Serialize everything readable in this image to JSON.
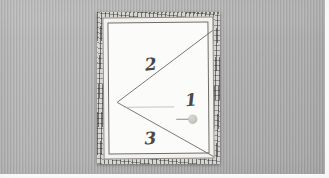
{
  "scene": {
    "title": "Framed canvas on textured wall",
    "description": "Photograph of a light-colored picture frame hung on a gray striped wall; the canvas inside is marked with hand-drawn diagonal lines dividing it into numbered regions."
  },
  "wall": {
    "name": "background-wall",
    "color": "#b2b2b2",
    "texture": "fine vertical stripes"
  },
  "frame": {
    "name": "picture-frame",
    "outer_color": "#d8d6d2",
    "mat_color": "#f3f2ef",
    "border_color": "#8d8b87",
    "canvas_color": "#fbfbf9"
  },
  "canvas": {
    "name": "canvas-surface",
    "line_color": "#6b6965",
    "marks": [
      {
        "id": "mark-1",
        "label": "1",
        "region": "right-center"
      },
      {
        "id": "mark-2",
        "label": "2",
        "region": "upper-left"
      },
      {
        "id": "mark-3",
        "label": "3",
        "region": "lower-left"
      }
    ],
    "marker": {
      "name": "tack-marker",
      "shape": "circle",
      "color": "#c9c6bf"
    }
  },
  "photo_border": {
    "color": "#ffffff"
  }
}
